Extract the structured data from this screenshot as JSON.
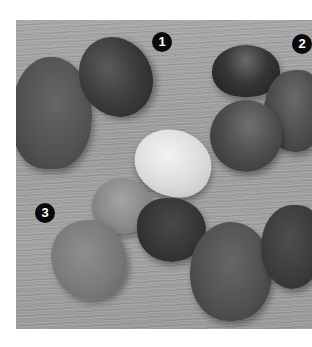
{
  "figure": {
    "background_color": "#ffffff",
    "wood_color": "#9e9e9e",
    "badge_color": "#0a0a0a",
    "callouts": [
      {
        "label": "1"
      },
      {
        "label": "2"
      },
      {
        "label": "3"
      }
    ],
    "stones": [
      {
        "name": "large-left-stone",
        "color": "#555555"
      },
      {
        "name": "dark-oval-stone",
        "color": "#3c3c3c"
      },
      {
        "name": "dark-round-stone-top-right",
        "color": "#333333"
      },
      {
        "name": "right-edge-stone",
        "color": "#4e4e4e"
      },
      {
        "name": "medium-stone-right",
        "color": "#4a4a4a"
      },
      {
        "name": "white-pebble",
        "color": "#d8d8d8"
      },
      {
        "name": "small-gray-stone",
        "color": "#8a8a8a"
      },
      {
        "name": "light-gray-stone",
        "color": "#7c7c7c"
      },
      {
        "name": "dark-heart-stone",
        "color": "#383838"
      },
      {
        "name": "large-bottom-stone",
        "color": "#555555"
      },
      {
        "name": "dark-right-stone",
        "color": "#3e3e3e"
      }
    ]
  }
}
